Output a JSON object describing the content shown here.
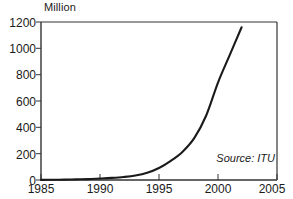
{
  "chart_data": {
    "type": "line",
    "title": "",
    "ylabel": "Million",
    "xlabel": "",
    "xlim": [
      1985,
      2005
    ],
    "ylim": [
      0,
      1200
    ],
    "grid": false,
    "legend": "none",
    "annotations": [
      {
        "name": "source",
        "text": "Source: ITU"
      }
    ],
    "xticks": [
      "1985",
      "1990",
      "1995",
      "2000",
      "2005"
    ],
    "yticks": [
      "0",
      "200",
      "400",
      "600",
      "800",
      "1000",
      "1200"
    ],
    "series": [
      {
        "name": "Mobile subscribers",
        "x": [
          1985,
          1986,
          1987,
          1988,
          1989,
          1990,
          1991,
          1992,
          1993,
          1994,
          1995,
          1996,
          1997,
          1998,
          1999,
          2000,
          2001,
          2002
        ],
        "values": [
          1,
          2,
          3,
          5,
          7,
          11,
          16,
          23,
          34,
          55,
          91,
          145,
          215,
          320,
          490,
          740,
          950,
          1160
        ]
      }
    ],
    "line_color": "#1a1a1a",
    "frame_color": "#333333"
  },
  "axis": {
    "y_label": "Million",
    "y_tick_0": "0",
    "y_tick_200": "200",
    "y_tick_400": "400",
    "y_tick_600": "600",
    "y_tick_800": "800",
    "y_tick_1000": "1000",
    "y_tick_1200": "1200",
    "x_tick_1985": "1985",
    "x_tick_1990": "1990",
    "x_tick_1995": "1995",
    "x_tick_2000": "2000",
    "x_tick_2005": "2005"
  },
  "source": {
    "text": "Source: ITU"
  }
}
